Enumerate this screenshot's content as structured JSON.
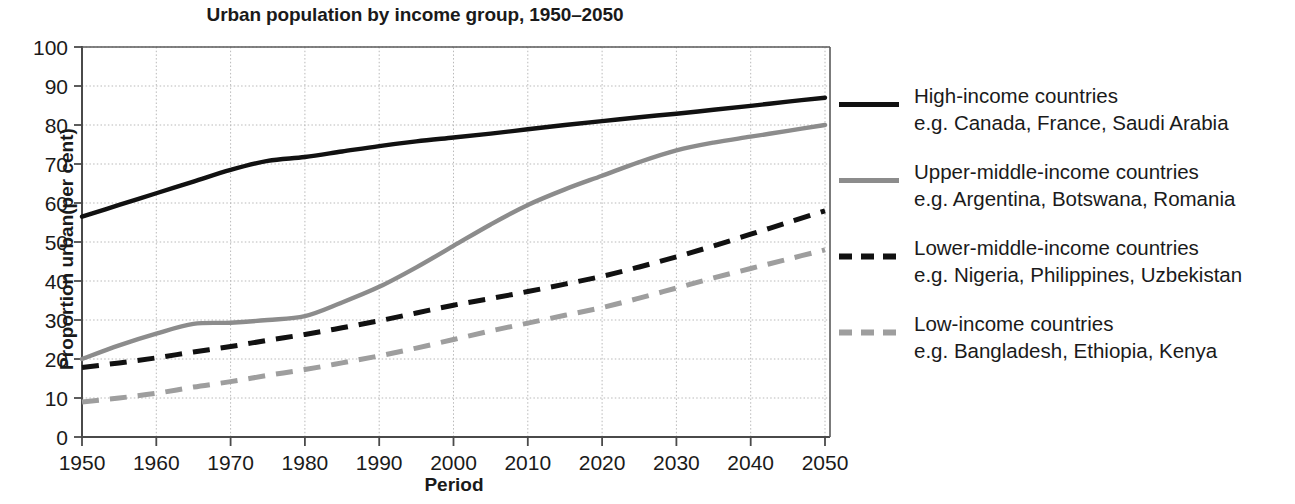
{
  "chart_data": {
    "type": "line",
    "title": "Urban population by income group, 1950–2050",
    "xlabel": "Period",
    "ylabel": "Proportion urban(per cent)",
    "xlim": [
      1950,
      2050
    ],
    "ylim": [
      0,
      100
    ],
    "grid": true,
    "legend_position": "right",
    "x_ticks": [
      "1950",
      "1960",
      "1970",
      "1980",
      "1990",
      "2000",
      "2010",
      "2020",
      "2030",
      "2040",
      "2050"
    ],
    "y_ticks": [
      "0",
      "10",
      "20",
      "30",
      "40",
      "50",
      "60",
      "70",
      "80",
      "90",
      "100"
    ],
    "x": [
      1950,
      1955,
      1960,
      1965,
      1970,
      1975,
      1980,
      1985,
      1990,
      1995,
      2000,
      2005,
      2010,
      2015,
      2020,
      2025,
      2030,
      2035,
      2040,
      2045,
      2050
    ],
    "series": [
      {
        "name": "High-income countries",
        "examples": "e.g. Canada, France, Saudi Arabia",
        "color": "#111111",
        "style": "solid",
        "values": [
          56.5,
          59.5,
          62.5,
          65.5,
          68.5,
          70.8,
          71.8,
          73.2,
          74.6,
          75.8,
          76.8,
          77.8,
          78.9,
          80.0,
          81.0,
          82.0,
          82.9,
          83.9,
          84.9,
          86.0,
          87.0
        ]
      },
      {
        "name": "Upper-middle-income countries",
        "examples": "e.g. Argentina, Botswana, Romania",
        "color": "#8c8c8c",
        "style": "solid",
        "values": [
          20.0,
          23.5,
          26.5,
          29.0,
          29.3,
          30.0,
          31.0,
          34.5,
          38.5,
          43.5,
          49.0,
          54.5,
          59.5,
          63.5,
          67.0,
          70.5,
          73.5,
          75.5,
          77.0,
          78.5,
          80.0
        ]
      },
      {
        "name": "Lower-middle-income countries",
        "examples": "e.g. Nigeria, Philippines, Uzbekistan",
        "color": "#111111",
        "style": "dashed",
        "values": [
          17.8,
          19.0,
          20.3,
          21.8,
          23.2,
          24.8,
          26.3,
          28.0,
          29.8,
          31.8,
          33.8,
          35.5,
          37.3,
          39.2,
          41.2,
          43.6,
          46.2,
          49.0,
          52.0,
          55.0,
          58.0
        ]
      },
      {
        "name": "Low-income countries",
        "examples": "e.g. Bangladesh, Ethiopia, Kenya",
        "color": "#9e9e9e",
        "style": "dashed",
        "values": [
          9.0,
          10.0,
          11.2,
          12.8,
          14.2,
          15.8,
          17.3,
          19.0,
          20.8,
          22.8,
          25.0,
          27.2,
          29.2,
          31.2,
          33.2,
          35.6,
          38.2,
          40.8,
          43.2,
          45.6,
          48.0
        ]
      }
    ]
  },
  "legend": [
    {
      "label": "High-income countries",
      "examples": "e.g. Canada, France, Saudi Arabia"
    },
    {
      "label": "Upper-middle-income countries",
      "examples": "e.g. Argentina, Botswana, Romania"
    },
    {
      "label": "Lower-middle-income countries",
      "examples": "e.g. Nigeria, Philippines, Uzbekistan"
    },
    {
      "label": "Low-income countries",
      "examples": "e.g. Bangladesh, Ethiopia, Kenya"
    }
  ]
}
